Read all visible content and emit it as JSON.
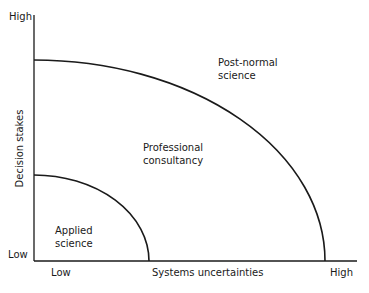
{
  "diagram": {
    "type": "region-diagram",
    "axes": {
      "y": {
        "title": "Decision stakes",
        "high_label": "High",
        "low_label": "Low"
      },
      "x": {
        "title": "Systems uncertainties",
        "low_label": "Low",
        "high_label": "High"
      }
    },
    "regions": [
      {
        "name": "Applied science",
        "line1": "Applied",
        "line2": "science"
      },
      {
        "name": "Professional consultancy",
        "line1": "Professional",
        "line2": "consultancy"
      },
      {
        "name": "Post-normal science",
        "line1": "Post-normal",
        "line2": "science"
      }
    ],
    "colors": {
      "line": "#1a1a1a",
      "background": "#ffffff"
    }
  }
}
